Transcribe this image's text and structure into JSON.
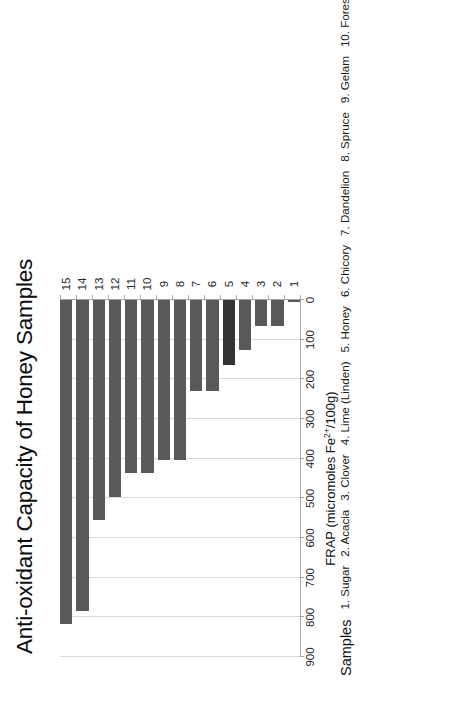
{
  "chart_data": {
    "type": "bar",
    "orientation": "horizontal",
    "title": "Anti-oxidant Capacity of Honey Samples",
    "xlabel": "FRAP (micromoles Fe²⁺/100g)",
    "ylabel": "",
    "categories": [
      "1",
      "2",
      "3",
      "4",
      "5",
      "6",
      "7",
      "8",
      "9",
      "10",
      "11",
      "12",
      "13",
      "14",
      "15"
    ],
    "values": [
      5,
      65,
      65,
      125,
      165,
      230,
      230,
      403,
      403,
      436,
      436,
      496,
      554,
      785,
      818
    ],
    "value_axis_ticks": [
      0,
      100,
      200,
      300,
      400,
      500,
      600,
      700,
      800,
      900
    ],
    "xlim": [
      0,
      900
    ],
    "grid": true,
    "legend_position": "above-plot",
    "bar_color": "#595959",
    "highlight_color": "#333333",
    "highlighted_category": "5",
    "value_axis_label_parts": {
      "prefix": "FRAP (micromoles Fe",
      "superscript": "2+",
      "suffix": "/100g)"
    }
  },
  "legend": {
    "heading": "Samples",
    "items": [
      "1. Sugar",
      "2. Acacia",
      "3. Clover",
      "4. Lime (Linden)",
      "5. Honey",
      "6. Chicory",
      "7. Dandelion",
      "8. Spruce",
      "9. Gelam",
      "10. Forest",
      "11. Manuka",
      "12. Fir",
      "13. Tualang",
      "14. Honeydew",
      "15. Buckwheat"
    ]
  }
}
